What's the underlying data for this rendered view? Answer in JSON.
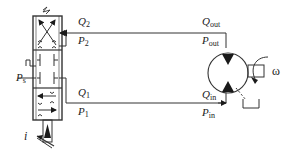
{
  "figure": {
    "type": "hydraulic-circuit-schematic",
    "components": {
      "servo_valve": {
        "label": "servo valve (4-way, 3-position)"
      },
      "hydraulic_motor": {
        "label": "bidirectional hydraulic motor"
      }
    }
  },
  "labels": {
    "q2": {
      "sym": "Q",
      "sub": "2"
    },
    "p2": {
      "sym": "P",
      "sub": "2"
    },
    "q1": {
      "sym": "Q",
      "sub": "1"
    },
    "p1": {
      "sym": "P",
      "sub": "1"
    },
    "ps": {
      "sym": "P",
      "sub": "s"
    },
    "i": {
      "sym": "i"
    },
    "qout": {
      "sym": "Q",
      "sub": "out"
    },
    "pout": {
      "sym": "P",
      "sub": "out"
    },
    "qin": {
      "sym": "Q",
      "sub": "in"
    },
    "pin": {
      "sym": "P",
      "sub": "in"
    },
    "omega": {
      "sym": "ω"
    }
  },
  "colors": {
    "line": "#333333",
    "fill": "#1a1a1a",
    "text": "#222222",
    "background": "#ffffff"
  }
}
